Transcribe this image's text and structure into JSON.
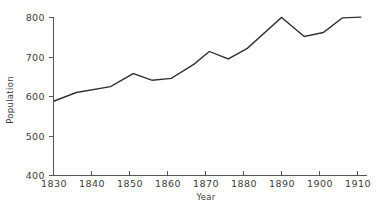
{
  "chart_data": {
    "type": "line",
    "title": "",
    "xlabel": "Year",
    "ylabel": "Population",
    "xlim": [
      1830,
      1911
    ],
    "ylim": [
      400,
      800
    ],
    "grid": false,
    "legend": null,
    "xticks": [
      1830,
      1840,
      1850,
      1860,
      1870,
      1880,
      1890,
      1900,
      1910
    ],
    "xtick_labels": [
      "1830",
      "1840",
      "1850",
      "1860",
      "1870",
      "1880",
      "1890",
      "1900",
      "1910"
    ],
    "yticks": [
      400,
      500,
      600,
      700,
      800
    ],
    "ytick_labels": [
      "400",
      "500",
      "600",
      "700",
      "800"
    ],
    "series": [
      {
        "name": "Population",
        "color": "#333333",
        "x": [
          1830,
          1836,
          1845,
          1851,
          1856,
          1861,
          1867,
          1871,
          1876,
          1881,
          1890,
          1896,
          1901,
          1906,
          1911
        ],
        "values": [
          588,
          610,
          625,
          658,
          641,
          646,
          682,
          714,
          695,
          722,
          800,
          752,
          762,
          799,
          801
        ]
      }
    ]
  },
  "axes": {
    "y_title": "Population",
    "x_title": "Year"
  }
}
